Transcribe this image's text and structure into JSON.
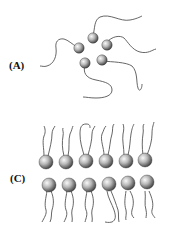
{
  "panels": [
    {
      "label": "(A)",
      "description": "Micelle-like cluster of five spheres with wavy tails radiating outward"
    },
    {
      "label": "(C)",
      "description": "Bilayer of twelve spheres in two rows of six, tails pointing up from top row and down from bottom row"
    }
  ],
  "colors": {
    "tail": "#555555",
    "sphere_light": "#f4f4f4",
    "sphere_dark": "#4a4a4a",
    "label": "#111111"
  }
}
